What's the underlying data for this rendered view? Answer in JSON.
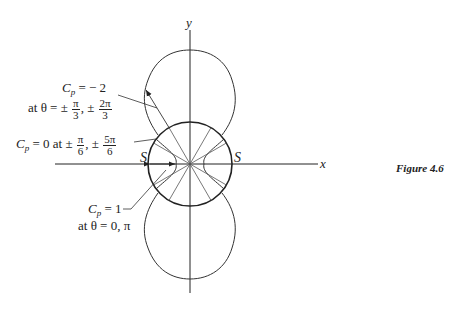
{
  "figure": {
    "caption": "Figure 4.6",
    "axes": {
      "x_label": "x",
      "y_label": "y"
    },
    "stagnation_label_left": "S",
    "stagnation_label_right": "S",
    "annotations": {
      "cp_minus2": {
        "line1_c": "C",
        "line1_sub": "p",
        "line1_rest": " = − 2",
        "line2_prefix": "at θ = ±",
        "frac1_num": "π",
        "frac1_den": "3",
        "sep": ", ±",
        "frac2_num": "2π",
        "frac2_den": "3"
      },
      "cp_zero": {
        "c": "C",
        "sub": "p",
        "rest": " = 0 at ±",
        "frac1_num": "π",
        "frac1_den": "6",
        "sep": ", ±",
        "frac2_num": "5π",
        "frac2_den": "6"
      },
      "cp_one": {
        "line1_c": "C",
        "line1_sub": "p",
        "line1_rest": " = 1",
        "line2": "at θ = 0, π"
      }
    },
    "colors": {
      "ink": "#222222",
      "background": "#ffffff"
    }
  }
}
